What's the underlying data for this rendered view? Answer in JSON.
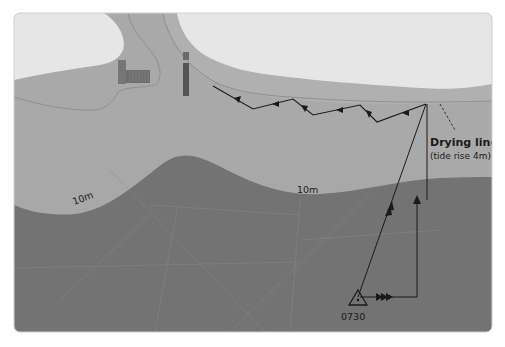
{
  "diagram": {
    "type": "nautical-passage-plan",
    "colors": {
      "land": "#e4e4e4",
      "shallow": "#a9a9a9",
      "drying_band": "#b3b3b3",
      "deep": "#737373",
      "track": "#1a1a1a",
      "structure": "#676767",
      "pier": "#5a5a5a",
      "background": "#ffffff"
    },
    "labels": {
      "drying_line_title": "Drying line",
      "drying_line_sub": "(tide rise 4m)",
      "depth_contour_left": "10m",
      "depth_contour_mid": "10m",
      "start_time": "0730"
    },
    "legend_icons": {
      "start_position": "triangle-fix-icon",
      "tidal_stream": "triple-arrow-icon",
      "course_arrow": "single-arrow-icon",
      "track_arrow": "double-arrow-icon"
    }
  }
}
